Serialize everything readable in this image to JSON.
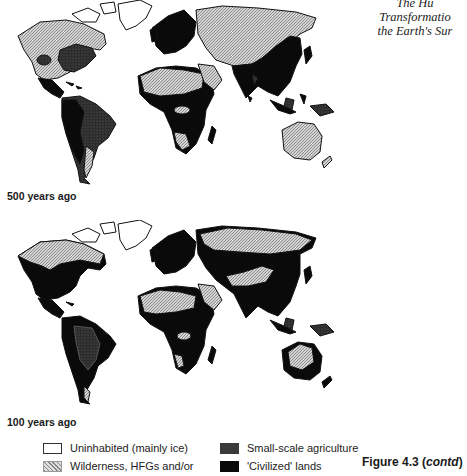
{
  "header": {
    "lines": [
      "The Hu",
      "Transformatio",
      "the Earth's Sur"
    ]
  },
  "maps": [
    {
      "label": "500 years ago",
      "period": "500 years ago"
    },
    {
      "label": "100 years ago",
      "period": "100 years ago"
    }
  ],
  "legend": {
    "items": [
      {
        "label": "Uninhabited (mainly ice)",
        "pattern": "white",
        "color": "#ffffff"
      },
      {
        "label": "Wilderness, HFGs and/or",
        "pattern": "hatched",
        "color": "#c8c8c8"
      },
      {
        "label": "Small-scale agriculture",
        "pattern": "dark-stipple",
        "color": "#3a3a3a"
      },
      {
        "label": "'Civilized' lands",
        "pattern": "solid-black",
        "color": "#0a0a0a"
      }
    ]
  },
  "figure_caption": {
    "prefix": "Figure 4.3 (",
    "italic": "contd",
    "suffix": ")"
  },
  "colors": {
    "ice": "#ffffff",
    "wilderness": "#c8c8c8",
    "agriculture": "#3a3a3a",
    "civilized": "#0a0a0a",
    "outline": "#111111"
  }
}
